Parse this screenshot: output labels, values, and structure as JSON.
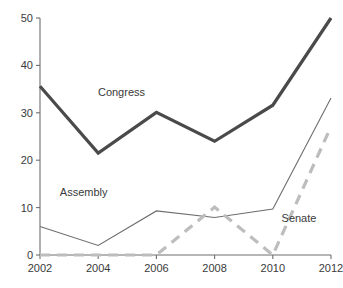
{
  "chart_data": {
    "type": "line",
    "title": "",
    "subtitle": "",
    "xlabel": "",
    "ylabel": "",
    "x": [
      2002,
      2004,
      2006,
      2008,
      2010,
      2012
    ],
    "categories": [
      "2002",
      "2004",
      "2006",
      "2008",
      "2010",
      "2012"
    ],
    "xlim": [
      2002,
      2012
    ],
    "ylim": [
      0,
      50
    ],
    "yticks": [
      0,
      10,
      20,
      30,
      40,
      50
    ],
    "ytick_labels": [
      "0",
      "10",
      "20",
      "30",
      "40",
      "50"
    ],
    "xtick_labels": [
      "2002",
      "2004",
      "2006",
      "2008",
      "2010",
      "2012"
    ],
    "grid": false,
    "legend_position": "inline-annotations",
    "series": [
      {
        "name": "Congress",
        "values": [
          35.6,
          21.5,
          30.1,
          24.0,
          31.6,
          50.0
        ],
        "color": "#4a4a4a",
        "style": "solid",
        "width": 3.2,
        "label_x": 2004.8,
        "label_y": 33.5
      },
      {
        "name": "Assembly",
        "values": [
          6.0,
          2.0,
          9.3,
          7.9,
          9.7,
          33.1
        ],
        "color": "#6e6e6e",
        "style": "solid",
        "width": 1.1,
        "label_x": 2003.5,
        "label_y": 12.4
      },
      {
        "name": "Senate",
        "values": [
          0.0,
          0.0,
          0.0,
          10.1,
          0.0,
          27.1
        ],
        "color": "#bdbdbd",
        "style": "dashed",
        "width": 3.2,
        "label_x": 2010.9,
        "label_y": 7.0
      }
    ]
  },
  "axes": {
    "y_axis_name": "value-axis",
    "x_axis_name": "year-axis"
  }
}
